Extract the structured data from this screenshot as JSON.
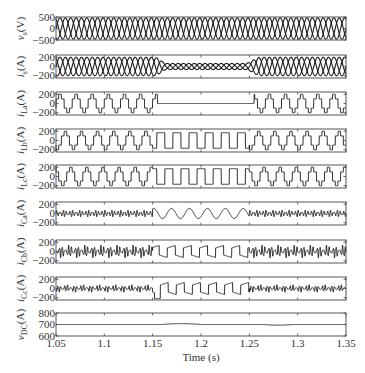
{
  "chart_data": {
    "type": "line",
    "title": "",
    "xlabel": "Time (s)",
    "xlim": [
      1.05,
      1.35
    ],
    "xticks": [
      1.05,
      1.1,
      1.15,
      1.2,
      1.25,
      1.3,
      1.35
    ],
    "xtick_labels": [
      "1.05",
      "1.1",
      "1.15",
      "1.2",
      "1.25",
      "1.3",
      "1.35"
    ],
    "grid": false,
    "legend": null,
    "fundamental_hz": 60,
    "events": {
      "fault_start_s": 1.155,
      "fault_end_s": 1.255
    },
    "panels": [
      {
        "id": "vs",
        "ylabel": "v_s (V)",
        "ylabel_main": "v",
        "ylabel_sub": "s",
        "ylabel_unit": "(V)",
        "ylim": [
          -500,
          500
        ],
        "yticks": [
          -500,
          0,
          500
        ],
        "ytick_labels": [
          "−500",
          "0",
          "500"
        ],
        "series": [
          {
            "name": "v_sa",
            "kind": "three_phase_sine",
            "amplitude": 460,
            "phase_deg": 0
          },
          {
            "name": "v_sb",
            "kind": "three_phase_sine",
            "amplitude": 460,
            "phase_deg": -120
          },
          {
            "name": "v_sc",
            "kind": "three_phase_sine",
            "amplitude": 460,
            "phase_deg": 120
          }
        ],
        "description": "Balanced three-phase source voltage, ~460 V peak, constant over the full interval"
      },
      {
        "id": "is",
        "ylabel": "i_s (A)",
        "ylabel_main": "i",
        "ylabel_sub": "s",
        "ylabel_unit": "(A)",
        "ylim": [
          -250,
          250
        ],
        "yticks": [
          -200,
          0,
          200
        ],
        "ytick_labels": [
          "−200",
          "0",
          "200"
        ],
        "amplitude_normal": 200,
        "amplitude_reduced": 65,
        "description": "Three-phase source current, ~200 A peak; drops to ~65 A between ~1.155 s and ~1.255 s then recovers"
      },
      {
        "id": "iLa",
        "ylabel": "i_La (A)",
        "ylabel_main": "i",
        "ylabel_sub": "La",
        "ylabel_unit": "(A)",
        "ylim": [
          -250,
          250
        ],
        "yticks": [
          -200,
          0,
          200
        ],
        "ytick_labels": [
          "−200",
          "0",
          "200"
        ],
        "amplitude": 200,
        "description": "Six-step stepped load current phase a; zero (open phase) from ~1.15 s to ~1.25 s"
      },
      {
        "id": "iLb",
        "ylabel": "i_Lb (A)",
        "ylabel_main": "i",
        "ylabel_sub": "Lb",
        "ylabel_unit": "(A)",
        "ylim": [
          -250,
          250
        ],
        "yticks": [
          -200,
          0,
          200
        ],
        "ytick_labels": [
          "−200",
          "0",
          "200"
        ],
        "amplitude": 200,
        "description": "Stepped load current phase b; becomes near-square single-phase shape during 1.15–1.25 s"
      },
      {
        "id": "iLc",
        "ylabel": "i_Lc (A)",
        "ylabel_main": "i",
        "ylabel_sub": "Lc",
        "ylabel_unit": "(A)",
        "ylim": [
          -250,
          250
        ],
        "yticks": [
          -200,
          0,
          200
        ],
        "ytick_labels": [
          "−200",
          "0",
          "200"
        ],
        "amplitude": 200,
        "description": "Stepped load current phase c; near-square shape during 1.15–1.25 s"
      },
      {
        "id": "iCa",
        "ylabel": "i_Ca (A)",
        "ylabel_main": "i",
        "ylabel_sub": "Ca",
        "ylabel_unit": "(A)",
        "ylim": [
          -250,
          250
        ],
        "yticks": [
          -200,
          0,
          200
        ],
        "ytick_labels": [
          "−200",
          "0",
          "200"
        ],
        "amplitude_normal": 70,
        "amplitude_fault": 110,
        "description": "Compensator current phase a; harmonic ripple ~±70 A, becomes smooth sinusoid ~±110 A during fault"
      },
      {
        "id": "iCb",
        "ylabel": "i_Cb (A)",
        "ylabel_main": "i",
        "ylabel_sub": "Cb",
        "ylabel_unit": "(A)",
        "ylim": [
          -250,
          250
        ],
        "yticks": [
          -200,
          0,
          200
        ],
        "ytick_labels": [
          "−200",
          "0",
          "200"
        ],
        "amplitude_normal": 120,
        "amplitude_fault": 140,
        "description": "Compensator current phase b; harmonic ripple, square-ish sawtooth during fault"
      },
      {
        "id": "iCc",
        "ylabel": "i_Cc (A)",
        "ylabel_main": "i",
        "ylabel_sub": "Cc",
        "ylabel_unit": "(A)",
        "ylim": [
          -250,
          250
        ],
        "yticks": [
          -200,
          0,
          200
        ],
        "ytick_labels": [
          "−200",
          "0",
          "200"
        ],
        "amplitude_normal": 70,
        "amplitude_fault": 150,
        "description": "Compensator current phase c; harmonic ripple, sawtooth-like during fault with dip to ~−220 A at 1.155 s"
      },
      {
        "id": "vDC",
        "ylabel": "v_DC (A)",
        "ylabel_main": "v",
        "ylabel_sub": "DC",
        "ylabel_unit": "(A)",
        "ylim": [
          600,
          800
        ],
        "yticks": [
          600,
          700,
          800
        ],
        "ytick_labels": [
          "600",
          "700",
          "800"
        ],
        "nominal": 700,
        "deviation": [
          {
            "t_start": 1.16,
            "t_end": 1.2,
            "peak": 708
          },
          {
            "t_start": 1.265,
            "t_end": 1.295,
            "peak": 694
          }
        ],
        "description": "DC-link voltage held at ~700 V with small ripple bumps during the fault interval"
      }
    ]
  }
}
